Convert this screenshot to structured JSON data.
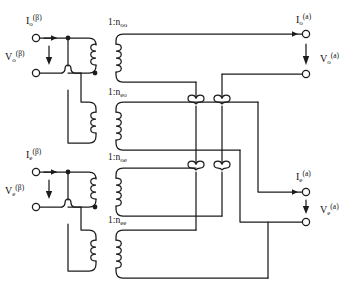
{
  "figure": {
    "type": "circuit-diagram",
    "background_color": "#ffffff",
    "line_color": "#1c1c1c"
  },
  "ports": {
    "input_odd": {
      "current_label": "I",
      "current_sub": "o",
      "current_sup": "(β)",
      "voltage_label": "V",
      "voltage_sub": "o",
      "voltage_sup": "(β)",
      "current_arrow": "right",
      "voltage_arrow": "down"
    },
    "input_even": {
      "current_label": "I",
      "current_sub": "e",
      "current_sup": "(β)",
      "voltage_label": "V",
      "voltage_sub": "e",
      "voltage_sup": "(β)",
      "current_arrow": "right",
      "voltage_arrow": "down"
    },
    "output_odd": {
      "current_label": "I",
      "current_sub": "o",
      "current_sup": "(a)",
      "voltage_label": "V",
      "voltage_sub": "o",
      "voltage_sup": "(a)",
      "current_arrow": "right",
      "voltage_arrow": "down"
    },
    "output_even": {
      "current_label": "I",
      "current_sub": "e",
      "current_sup": "(a)",
      "voltage_label": "V",
      "voltage_sub": "e",
      "voltage_sup": "(a)",
      "current_arrow": "right",
      "voltage_arrow": "down"
    }
  },
  "transformers": [
    {
      "id": "t-oo",
      "ratio_prefix": "1:",
      "ratio_symbol": "n",
      "ratio_sub": "oo",
      "primary_turns": 3,
      "secondary_turns": 4
    },
    {
      "id": "t-eo",
      "ratio_prefix": "1:",
      "ratio_symbol": "n",
      "ratio_sub": "eo",
      "primary_turns": 3,
      "secondary_turns": 4
    },
    {
      "id": "t-oe",
      "ratio_prefix": "1:",
      "ratio_symbol": "n",
      "ratio_sub": "oe",
      "primary_turns": 3,
      "secondary_turns": 4
    },
    {
      "id": "t-ee",
      "ratio_prefix": "1:",
      "ratio_symbol": "n",
      "ratio_sub": "ee",
      "primary_turns": 3,
      "secondary_turns": 4
    }
  ]
}
